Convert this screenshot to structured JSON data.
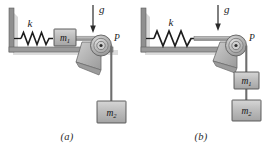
{
  "figure": {
    "type": "physics-diagram",
    "colors": {
      "wall": "#8d8d8d",
      "wall_shadow": "#cfcfcf",
      "rod": "#9a9a9a",
      "block_fill": "#bdbdbd",
      "block_edge": "#555555",
      "pulley_fill": "#b6b6b6",
      "bracket_fill": "#b0b0b0",
      "spring": "#1c1c1c",
      "cord": "#6e6e6e",
      "text": "#1b1b1b"
    }
  },
  "panels": [
    {
      "id": "a",
      "caption": "(a)",
      "gravity_label": "g",
      "spring_label": "k",
      "pulley_label": "P",
      "blocks": [
        {
          "label": "m",
          "subscript": "1",
          "position": "on-horizontal-rod"
        },
        {
          "label": "m",
          "subscript": "2",
          "position": "hanging"
        }
      ]
    },
    {
      "id": "b",
      "caption": "(b)",
      "gravity_label": "g",
      "spring_label": "k",
      "pulley_label": "P",
      "blocks": [
        {
          "label": "m",
          "subscript": "1",
          "position": "hanging-upper"
        },
        {
          "label": "m",
          "subscript": "2",
          "position": "hanging-lower"
        }
      ]
    }
  ]
}
